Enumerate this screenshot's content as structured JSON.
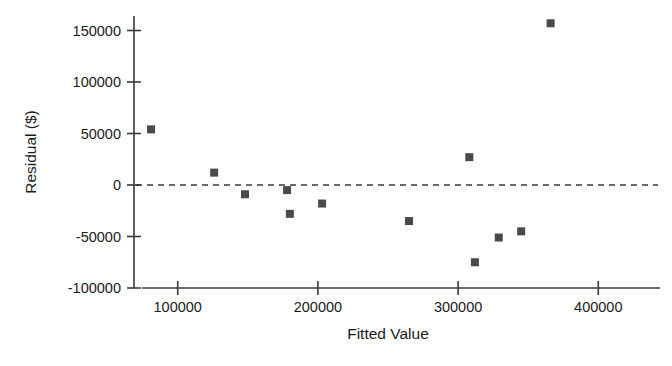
{
  "chart_data": {
    "type": "scatter",
    "title": "",
    "xlabel": "Fitted Value",
    "ylabel": "Residual ($)",
    "xlim": [
      70000,
      415000
    ],
    "ylim": [
      -110000,
      165000
    ],
    "xticks": [
      100000,
      200000,
      300000,
      400000
    ],
    "xticklabels": [
      "100000",
      "200000",
      "300000",
      "400000"
    ],
    "yticks": [
      -100000,
      -50000,
      0,
      50000,
      100000,
      150000
    ],
    "yticklabels": [
      "-100000",
      "-50000",
      "0",
      "50000",
      "100000",
      "150000"
    ],
    "grid": false,
    "legend": null,
    "reference_line": {
      "type": "horizontal",
      "y": 0,
      "style": "dashed",
      "color": "#3a3a3a"
    },
    "marker": {
      "shape": "square",
      "color": "#4a4a4a",
      "size": 8
    },
    "series": [
      {
        "name": "Residuals",
        "points": [
          {
            "x": 81000,
            "y": 54000
          },
          {
            "x": 126000,
            "y": 12000
          },
          {
            "x": 148000,
            "y": -9000
          },
          {
            "x": 178000,
            "y": -5000
          },
          {
            "x": 180000,
            "y": -28000
          },
          {
            "x": 203000,
            "y": -18000
          },
          {
            "x": 265000,
            "y": -35000
          },
          {
            "x": 308000,
            "y": 27000
          },
          {
            "x": 312000,
            "y": -75000
          },
          {
            "x": 329000,
            "y": -51000
          },
          {
            "x": 345000,
            "y": -45000
          },
          {
            "x": 366000,
            "y": 157000
          }
        ]
      }
    ]
  },
  "axes": {
    "x_title": "Fitted Value",
    "y_title": "Residual ($)"
  }
}
